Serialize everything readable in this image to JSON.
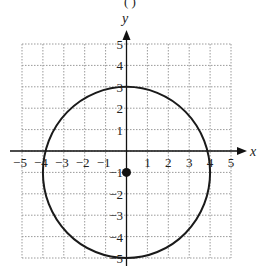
{
  "header": {
    "text": "(         )"
  },
  "chart_data": {
    "type": "line",
    "title": "",
    "xlabel": "x",
    "ylabel": "y",
    "xlim": [
      -5,
      5
    ],
    "ylim": [
      -5,
      5
    ],
    "grid": true,
    "x_ticks": [
      "-5",
      "-4",
      "-3",
      "-2",
      "-1",
      "1",
      "2",
      "3",
      "4",
      "5"
    ],
    "y_ticks": [
      "5",
      "4",
      "3",
      "2",
      "1",
      "-1",
      "-2",
      "-3",
      "-4",
      "-5"
    ],
    "series": [
      {
        "name": "circle",
        "shape": "circle",
        "center": [
          0,
          -1
        ],
        "radius": 4,
        "equation": "x^2 + (y+1)^2 = 16",
        "points": [
          [
            0,
            3
          ],
          [
            4,
            -1
          ],
          [
            0,
            -5
          ],
          [
            -4,
            -1
          ],
          [
            3.87,
            0
          ],
          [
            -3.87,
            0
          ]
        ]
      }
    ],
    "annotations": [
      {
        "type": "point",
        "x": 0,
        "y": -1,
        "label": "center",
        "filled": true
      }
    ],
    "colors": {
      "curve": "#1a1a1a",
      "grid": "#9a9a9a",
      "axis": "#111111"
    }
  }
}
